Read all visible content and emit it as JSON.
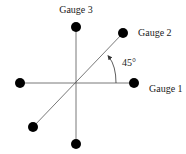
{
  "diagram": {
    "labels": {
      "gauge1": "Gauge 1",
      "gauge2": "Gauge 2",
      "gauge3": "Gauge 3",
      "angle": "45°"
    },
    "colors": {
      "line": "#555555",
      "dot": "#000000",
      "text": "#222222"
    }
  }
}
